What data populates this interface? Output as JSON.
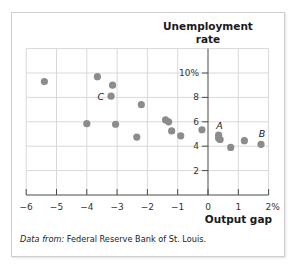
{
  "chart_data": {
    "type": "scatter",
    "title": "",
    "xlabel": "Output gap",
    "ylabel": "Unemployment rate",
    "ylabel_lines": [
      "Unemployment",
      "rate"
    ],
    "xlim": [
      -6,
      2
    ],
    "ylim": [
      0,
      12
    ],
    "x_ticks": [
      -6,
      -5,
      -4,
      -3,
      -2,
      -1,
      0,
      1,
      2
    ],
    "x_tick_labels": [
      "−6",
      "−5",
      "−4",
      "−3",
      "−2",
      "−1",
      "0",
      "1",
      "2%"
    ],
    "y_ticks": [
      2,
      4,
      6,
      8,
      10
    ],
    "y_tick_labels": [
      "2",
      "4",
      "6",
      "8",
      "10%"
    ],
    "grid": true,
    "legend": null,
    "marker_color": "#8c8c8c",
    "grid_color": "#d9d9d9",
    "series": [
      {
        "name": "Observations",
        "points": [
          {
            "x": -5.4,
            "y": 9.3
          },
          {
            "x": -3.65,
            "y": 9.7
          },
          {
            "x": -3.15,
            "y": 9.0
          },
          {
            "x": -3.2,
            "y": 8.1,
            "label": "C"
          },
          {
            "x": -2.2,
            "y": 7.4
          },
          {
            "x": -4.0,
            "y": 5.85
          },
          {
            "x": -3.05,
            "y": 5.8
          },
          {
            "x": -2.35,
            "y": 4.75
          },
          {
            "x": -1.4,
            "y": 6.15
          },
          {
            "x": -1.3,
            "y": 6.0
          },
          {
            "x": -1.2,
            "y": 5.25
          },
          {
            "x": -0.9,
            "y": 4.85
          },
          {
            "x": -0.2,
            "y": 5.35
          },
          {
            "x": 0.35,
            "y": 4.9,
            "label": "A"
          },
          {
            "x": 0.35,
            "y": 4.65
          },
          {
            "x": 0.4,
            "y": 4.55
          },
          {
            "x": 0.75,
            "y": 3.9
          },
          {
            "x": 1.2,
            "y": 4.45
          },
          {
            "x": 1.75,
            "y": 4.15,
            "label": "B"
          }
        ]
      }
    ],
    "annotations": [
      "A",
      "B",
      "C"
    ]
  },
  "source": {
    "prefix": "Data from:",
    "text": " Federal Reserve Bank of St. Louis."
  }
}
